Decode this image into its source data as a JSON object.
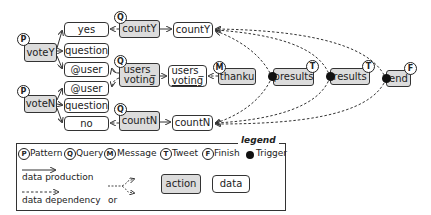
{
  "diagram": {
    "nodes": {
      "voteY": {
        "label": "voteY",
        "kind": "action",
        "badge": "P"
      },
      "voteN": {
        "label": "voteN",
        "kind": "action",
        "badge": "P"
      },
      "yes": {
        "label": "yes",
        "kind": "data"
      },
      "question_y": {
        "label": "question",
        "kind": "data"
      },
      "user_y": {
        "label": "@user",
        "kind": "data"
      },
      "user_n": {
        "label": "@user",
        "kind": "data"
      },
      "question_n": {
        "label": "question",
        "kind": "data"
      },
      "no": {
        "label": "no",
        "kind": "data"
      },
      "countY_action": {
        "label": "countY",
        "kind": "action",
        "badge": "Q"
      },
      "countY_data": {
        "label": "countY",
        "kind": "data"
      },
      "users_voting_action": {
        "label_line1": "users_",
        "label_line2": "voting",
        "kind": "action",
        "badge": "Q"
      },
      "users_voting_data": {
        "label_line1": "users_",
        "label_line2": "voting",
        "kind": "data"
      },
      "thanku": {
        "label": "thanku",
        "kind": "action",
        "badge": "M"
      },
      "presults": {
        "label": "presults",
        "kind": "action",
        "badge": "T",
        "trigger": true
      },
      "results": {
        "label": "results",
        "kind": "action",
        "badge": "T",
        "trigger": true
      },
      "end": {
        "label": "end",
        "kind": "action",
        "badge": "F",
        "trigger": true
      },
      "countN_action": {
        "label": "countN",
        "kind": "action",
        "badge": "Q"
      },
      "countN_data": {
        "label": "countN",
        "kind": "data"
      }
    },
    "edges": [
      {
        "from": "voteY",
        "to": "yes",
        "type": "data production"
      },
      {
        "from": "voteY",
        "to": "question_y",
        "type": "data production"
      },
      {
        "from": "voteY",
        "to": "user_y",
        "type": "data production"
      },
      {
        "from": "voteN",
        "to": "user_n",
        "type": "data production"
      },
      {
        "from": "voteN",
        "to": "question_n",
        "type": "data production"
      },
      {
        "from": "voteN",
        "to": "no",
        "type": "data production"
      },
      {
        "from": "countY_action",
        "to": "yes",
        "type": "data dependency"
      },
      {
        "from": "countY_action",
        "to": "countY_data",
        "type": "data production"
      },
      {
        "from": "users_voting_action",
        "to": [
          "user_y",
          "user_n"
        ],
        "type": "data dependency (or)"
      },
      {
        "from": "users_voting_action",
        "to": "users_voting_data",
        "type": "data production"
      },
      {
        "from": "thanku",
        "to": "users_voting_data",
        "type": "data dependency"
      },
      {
        "from": "countN_action",
        "to": "no",
        "type": "data dependency"
      },
      {
        "from": "countN_action",
        "to": "countN_data",
        "type": "data production"
      },
      {
        "from": "presults",
        "to": [
          "countY_data",
          "countN_data"
        ],
        "type": "data dependency"
      },
      {
        "from": "results",
        "to": [
          "countY_data",
          "countN_data"
        ],
        "type": "data dependency"
      },
      {
        "from": "end",
        "to": [
          "countY_data",
          "countN_data"
        ],
        "type": "data dependency"
      }
    ]
  },
  "legend": {
    "title": "legend",
    "badges": [
      {
        "glyph": "P",
        "label": "Pattern"
      },
      {
        "glyph": "Q",
        "label": "Query"
      },
      {
        "glyph": "M",
        "label": "Message"
      },
      {
        "glyph": "T",
        "label": "Tweet"
      },
      {
        "glyph": "F",
        "label": "Finish"
      }
    ],
    "trigger_label": "Trigger",
    "data_production_label": "data production",
    "data_dependency_label": "data dependency",
    "or_label": "or",
    "action_label": "action",
    "data_label": "data"
  },
  "colors": {
    "action_fill": "#dcdcdc",
    "data_fill": "#ffffff",
    "stroke": "#333333",
    "trigger": "#111111"
  }
}
